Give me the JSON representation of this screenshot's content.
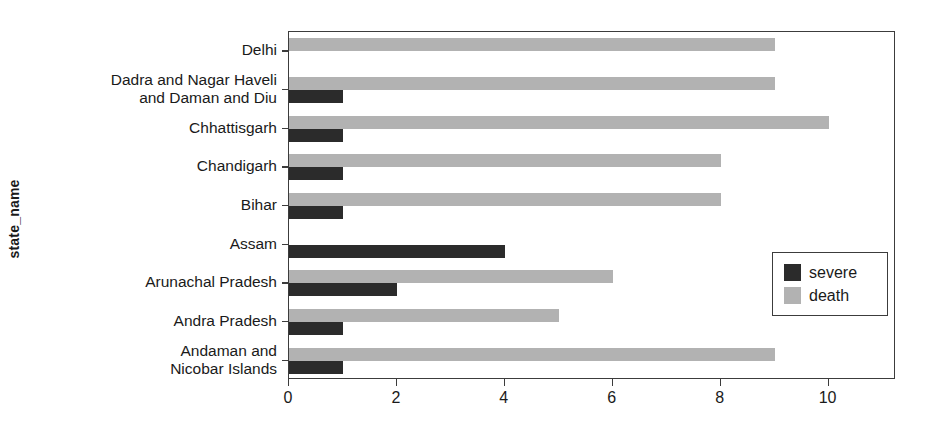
{
  "chart_data": {
    "type": "bar",
    "orientation": "horizontal",
    "title": "",
    "xlabel": "",
    "ylabel": "state_name",
    "xlim": [
      0,
      11.25
    ],
    "xticks": [
      0,
      2,
      4,
      6,
      8,
      10
    ],
    "xticklabels": [
      "0",
      "2",
      "4",
      "6",
      "8",
      "10"
    ],
    "grid": false,
    "legend_position": "center right",
    "categories": [
      "Andaman and\nNicobar Islands",
      "Andra Pradesh",
      "Arunachal Pradesh",
      "Assam",
      "Bihar",
      "Chandigarh",
      "Chhattisgarh",
      "Dadra and Nagar Haveli\nand Daman and Diu",
      "Delhi"
    ],
    "series": [
      {
        "name": "severe",
        "color": "#2b2b2b",
        "values": [
          1,
          1,
          2,
          4,
          1,
          1,
          1,
          1,
          0
        ]
      },
      {
        "name": "death",
        "color": "#b2b2b2",
        "values": [
          9,
          5,
          6,
          0,
          8,
          8,
          10,
          9,
          9
        ]
      }
    ]
  },
  "legend": {
    "entries": [
      {
        "label": "severe",
        "color": "#2b2b2b"
      },
      {
        "label": "death",
        "color": "#b2b2b2"
      }
    ]
  },
  "axis": {
    "y_title": "state_name"
  },
  "colors": {
    "severe": "#2b2b2b",
    "death": "#b2b2b2",
    "axis": "#3c3c3c",
    "background": "#ffffff",
    "text": "#1a1a1a"
  }
}
